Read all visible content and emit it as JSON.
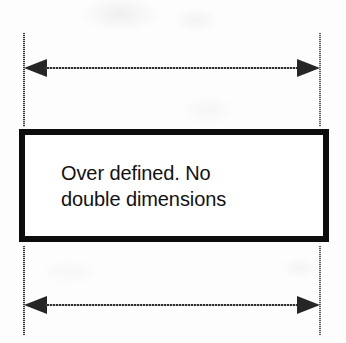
{
  "diagram": {
    "type": "engineering-dimension-diagram",
    "background_color": "#fdfdfd",
    "ink_color": "#111111",
    "note": {
      "line1": "Over defined. No",
      "line2": "double dimensions"
    },
    "dimensions": [
      {
        "name": "top-dimension",
        "position": "above-box",
        "arrow_style": "double-headed",
        "label": ""
      },
      {
        "name": "bottom-dimension",
        "position": "below-box",
        "arrow_style": "double-headed",
        "label": ""
      }
    ],
    "extension_lines": [
      {
        "name": "left-extension-line-top",
        "side": "left"
      },
      {
        "name": "right-extension-line-top",
        "side": "right"
      },
      {
        "name": "left-extension-line-bottom",
        "side": "left"
      },
      {
        "name": "right-extension-line-bottom",
        "side": "right"
      }
    ]
  }
}
